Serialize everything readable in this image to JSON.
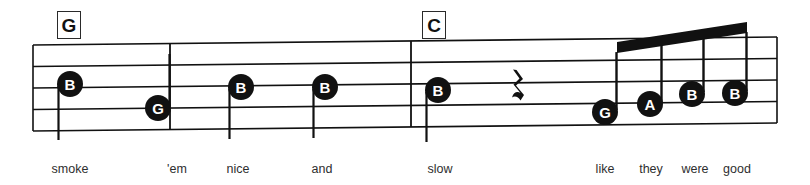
{
  "sheet": {
    "width": 810,
    "height": 185,
    "background": "#ffffff",
    "ink_color": "#111111",
    "lyric_color": "#2e2e2e"
  },
  "chords": [
    {
      "label": "G",
      "x": 57,
      "y": 11,
      "w": 24,
      "h": 28
    },
    {
      "label": "C",
      "x": 422,
      "y": 11,
      "w": 24,
      "h": 28
    }
  ],
  "staff": {
    "line_count": 5,
    "left_x": 33,
    "right_x": 777,
    "left_top_y": 45,
    "left_bottom_y": 131,
    "right_top_y": 37,
    "right_bottom_y": 123,
    "line_width": 1.6,
    "barlines": [
      170,
      411
    ]
  },
  "notes": [
    {
      "letter": "B",
      "x": 70,
      "y": 84,
      "stem": "down",
      "stem_len": 56,
      "lyric": "smoke"
    },
    {
      "letter": "G",
      "x": 158,
      "y": 108,
      "stem": "up",
      "stem_len": 54,
      "lyric": "'em"
    },
    {
      "letter": "B",
      "x": 241,
      "y": 87,
      "stem": "down",
      "stem_len": 52,
      "lyric": "nice"
    },
    {
      "letter": "B",
      "x": 325,
      "y": 87,
      "stem": "down",
      "stem_len": 51,
      "lyric": "and"
    },
    {
      "letter": "B",
      "x": 438,
      "y": 90,
      "stem": "down",
      "stem_len": 52,
      "lyric": "slow"
    },
    {
      "letter": "G",
      "x": 605,
      "y": 112,
      "stem": "beam",
      "lyric": "like"
    },
    {
      "letter": "A",
      "x": 650,
      "y": 104,
      "stem": "beam",
      "lyric": "they"
    },
    {
      "letter": "B",
      "x": 692,
      "y": 94,
      "stem": "beam",
      "lyric": "were"
    },
    {
      "letter": "B",
      "x": 735,
      "y": 93,
      "stem": "beam",
      "lyric": "good"
    }
  ],
  "rest": {
    "symbol": "♩",
    "glyph": "rest-quarter",
    "x": 518,
    "y": 88,
    "label": "quarter-rest"
  },
  "beam": {
    "x1": 617,
    "y1": 42,
    "x2": 747,
    "y2": 22,
    "thickness": 11,
    "color": "#111111"
  },
  "lyrics": [
    {
      "text": "smoke",
      "x": 70,
      "y": 163
    },
    {
      "text": "'em",
      "x": 177,
      "y": 163
    },
    {
      "text": "nice",
      "x": 238,
      "y": 163
    },
    {
      "text": "and",
      "x": 322,
      "y": 163
    },
    {
      "text": "slow",
      "x": 440,
      "y": 163
    },
    {
      "text": "like",
      "x": 605,
      "y": 163
    },
    {
      "text": "they",
      "x": 651,
      "y": 163
    },
    {
      "text": "were",
      "x": 695,
      "y": 163
    },
    {
      "text": "good",
      "x": 737,
      "y": 163
    }
  ]
}
